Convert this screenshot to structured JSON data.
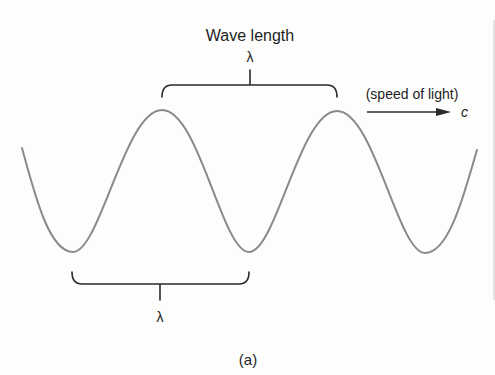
{
  "figure": {
    "title": "Wave length",
    "top_lambda": "λ",
    "bottom_lambda": "λ",
    "speed_label": "(speed of light)",
    "speed_symbol": "c",
    "caption": "(a)"
  },
  "colors": {
    "wave": "#8a8a8a",
    "ink": "#1e1e1e",
    "background": "#fdfdfc"
  }
}
